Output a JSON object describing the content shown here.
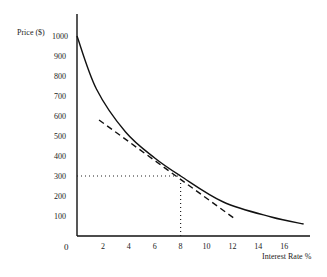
{
  "chart_data": {
    "type": "line",
    "title": "",
    "xlabel": "Interest Rate %",
    "ylabel": "Price ($)",
    "xlim": [
      0,
      18
    ],
    "ylim": [
      0,
      1100
    ],
    "grid": false,
    "legend": null,
    "x_ticks": [
      2,
      4,
      6,
      8,
      10,
      12,
      14,
      16
    ],
    "y_ticks": [
      100,
      200,
      300,
      400,
      500,
      600,
      700,
      800,
      900,
      1000
    ],
    "origin_label": "0",
    "series": [
      {
        "name": "Price-yield curve",
        "style": "solid",
        "x": [
          0,
          1.5,
          3.75,
          6,
          8,
          11.3,
          15,
          17.5
        ],
        "values": [
          1000,
          735,
          520,
          390,
          300,
          170,
          95,
          60
        ]
      },
      {
        "name": "Tangent line at 8%",
        "style": "dashed",
        "x": [
          1.7,
          8,
          12.1
        ],
        "values": [
          580,
          300,
          90
        ]
      }
    ],
    "annotations": [
      {
        "type": "dotted-guide",
        "from": [
          0,
          300
        ],
        "to": [
          8,
          300
        ],
        "description": "horizontal guide at price 300"
      },
      {
        "type": "dotted-guide",
        "from": [
          8,
          0
        ],
        "to": [
          8,
          300
        ],
        "description": "vertical guide at 8% rate"
      }
    ]
  }
}
